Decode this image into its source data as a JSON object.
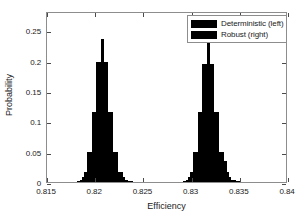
{
  "chart_data": {
    "type": "bar",
    "title": "",
    "subtitle": "",
    "xlabel": "Efficiency",
    "ylabel": "Probability",
    "xlim": [
      0.815,
      0.84
    ],
    "ylim": [
      0,
      0.2815
    ],
    "xticks": [
      0.815,
      0.82,
      0.825,
      0.83,
      0.835,
      0.84
    ],
    "xtick_labels": [
      "0.815",
      "0.82",
      "0.825",
      "0.83",
      "0.835",
      "0.84"
    ],
    "yticks": [
      0,
      0.05,
      0.1,
      0.15,
      0.2,
      0.25
    ],
    "ytick_labels": [
      "0",
      "0.05",
      "0.1",
      "0.15",
      "0.2",
      "0.25"
    ],
    "grid": false,
    "legend_position": "top-right",
    "bar_color": "#000000",
    "bin_width": 0.00025,
    "series": [
      {
        "name": "Deterministic (left)",
        "x": [
          0.81825,
          0.8185,
          0.81875,
          0.819,
          0.81925,
          0.8195,
          0.81975,
          0.82,
          0.82025,
          0.8205,
          0.82075,
          0.821,
          0.82125,
          0.8215,
          0.82175,
          0.822,
          0.82225,
          0.8225,
          0.82275,
          0.823,
          0.82325,
          0.8235,
          0.82375
        ],
        "values": [
          0.002,
          0.004,
          0.008,
          0.016,
          0.05,
          0.05,
          0.115,
          0.115,
          0.197,
          0.197,
          0.235,
          0.197,
          0.197,
          0.115,
          0.115,
          0.05,
          0.05,
          0.016,
          0.016,
          0.008,
          0.004,
          0.002,
          0.002
        ]
      },
      {
        "name": "Robust (right)",
        "x": [
          0.82925,
          0.8295,
          0.82975,
          0.83,
          0.83025,
          0.8305,
          0.83075,
          0.831,
          0.83125,
          0.8315,
          0.83175,
          0.832,
          0.83225,
          0.8325,
          0.83275,
          0.833,
          0.83325,
          0.8335,
          0.83375,
          0.834,
          0.83425,
          0.8345,
          0.83475,
          0.835
        ],
        "values": [
          0.002,
          0.004,
          0.008,
          0.016,
          0.05,
          0.05,
          0.115,
          0.115,
          0.195,
          0.195,
          0.233,
          0.195,
          0.195,
          0.115,
          0.115,
          0.05,
          0.05,
          0.035,
          0.016,
          0.008,
          0.004,
          0.004,
          0.002,
          0.002
        ]
      }
    ]
  },
  "legend": {
    "entries": [
      {
        "label": "Deterministic (left)",
        "color": "#000000"
      },
      {
        "label": "Robust (right)",
        "color": "#000000"
      }
    ]
  }
}
